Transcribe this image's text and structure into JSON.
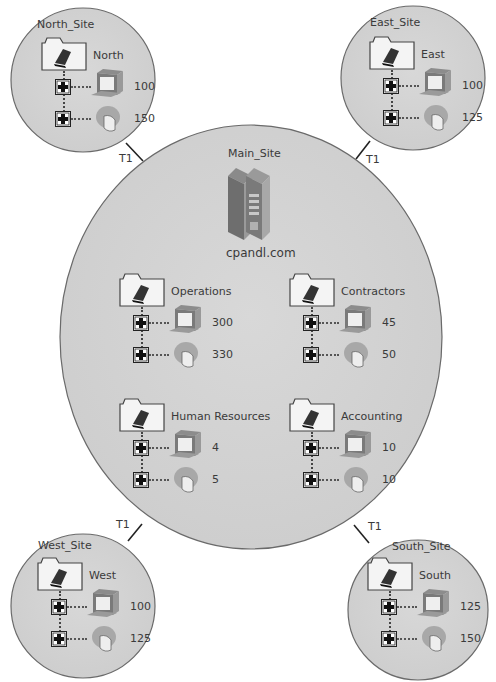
{
  "colors": {
    "site_fill": "#d2d2d2",
    "site_stroke": "#6a6a6a",
    "link": "#222222",
    "text": "#3a3a3a"
  },
  "main_site": {
    "title": "Main_Site",
    "server_icon": "server-rack-icon",
    "domain": "cpandl.com",
    "ous": [
      {
        "name": "Operations",
        "computers": "300",
        "users": "330"
      },
      {
        "name": "Contractors",
        "computers": "45",
        "users": "50"
      },
      {
        "name": "Human Resources",
        "computers": "4",
        "users": "5"
      },
      {
        "name": "Accounting",
        "computers": "10",
        "users": "10"
      }
    ]
  },
  "sites": {
    "north": {
      "title": "North_Site",
      "ou": "North",
      "computers": "100",
      "users": "150",
      "link": "T1"
    },
    "east": {
      "title": "East_Site",
      "ou": "East",
      "computers": "100",
      "users": "125",
      "link": "T1"
    },
    "west": {
      "title": "West_Site",
      "ou": "West",
      "computers": "100",
      "users": "125",
      "link": "T1"
    },
    "south": {
      "title": "South_Site",
      "ou": "South",
      "computers": "125",
      "users": "150",
      "link": "T1"
    }
  },
  "icons": {
    "folder": "ou-folder-icon",
    "expand": "plus-box-icon",
    "computer": "computer-monitor-icon",
    "user": "user-head-icon"
  }
}
